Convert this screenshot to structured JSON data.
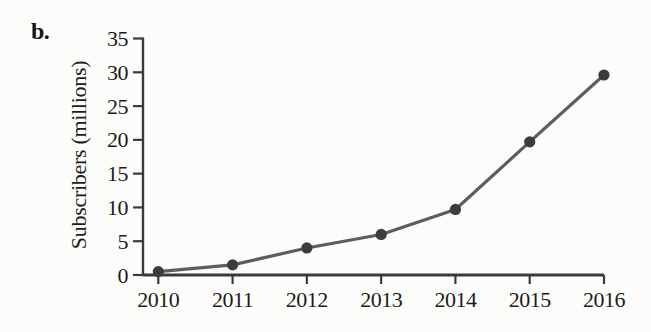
{
  "figure": {
    "panel_label": "b."
  },
  "chart_data": {
    "type": "line",
    "categories": [
      "2010",
      "2011",
      "2012",
      "2013",
      "2014",
      "2015",
      "2016"
    ],
    "values": [
      0.5,
      1.5,
      4,
      6,
      9.7,
      19.7,
      29.6
    ],
    "title": "",
    "xlabel": "",
    "ylabel": "Subscribers (millions)",
    "ylim": [
      0,
      35
    ],
    "yticks": [
      0,
      5,
      10,
      15,
      20,
      25,
      30,
      35
    ],
    "grid": false,
    "legend_position": "none",
    "marker": "circle",
    "colors": {
      "line": "#5d5d5d",
      "marker": "#3c3c3c",
      "axis": "#3a3a3a",
      "text": "#1c1c1c",
      "background": "#fcfcfa"
    }
  }
}
